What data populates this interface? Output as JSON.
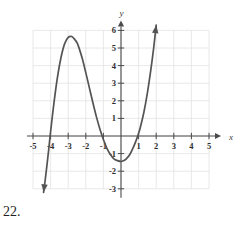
{
  "problem": {
    "number_label": "22."
  },
  "figure": {
    "name": "cubic-function-graph",
    "axis_labels": {
      "x": "x",
      "y": "y"
    },
    "colors": {
      "curve": "#545454",
      "axis": "#4a4a4a",
      "grid": "#e2e2e2",
      "text": "#2e2e2e"
    }
  },
  "chart_data": {
    "type": "line",
    "title": "",
    "xlabel": "x",
    "ylabel": "y",
    "xlim": [
      -5,
      5
    ],
    "ylim": [
      -3,
      6
    ],
    "grid": true,
    "legend": "none",
    "xticks": [
      -5,
      -4,
      -3,
      -2,
      -1,
      1,
      2,
      3,
      4,
      5
    ],
    "xtick_labels": [
      "-5",
      "-4",
      "-3",
      "-2",
      "-1",
      "1",
      "2",
      "3",
      "4",
      "5"
    ],
    "yticks": [
      -3,
      -2,
      -1,
      1,
      2,
      3,
      4,
      5,
      6
    ],
    "ytick_labels": [
      "-3",
      "-2",
      "-1",
      "1",
      "2",
      "3",
      "4",
      "5",
      "6"
    ],
    "series": [
      {
        "name": "cubic",
        "style": "solid",
        "arrows": [
          "start",
          "end"
        ],
        "x": [
          -4.4,
          -4.3,
          -4.2,
          -4.1,
          -4.0,
          -3.8,
          -3.6,
          -3.4,
          -3.2,
          -3.0,
          -2.8,
          -2.6,
          -2.5,
          -2.4,
          -2.2,
          -2.0,
          -1.8,
          -1.6,
          -1.4,
          -1.2,
          -1.0,
          -0.8,
          -0.6,
          -0.4,
          -0.2,
          0.0,
          0.15,
          0.3,
          0.5,
          0.7,
          0.9,
          1.0,
          1.1,
          1.3,
          1.5,
          1.7,
          1.85,
          2.0,
          2.2,
          2.4,
          2.6,
          2.75
        ],
        "y": [
          -3.2,
          -2.45,
          -1.6,
          -0.7,
          0.25,
          1.95,
          3.4,
          4.5,
          5.25,
          5.6,
          5.65,
          5.45,
          5.3,
          5.05,
          4.4,
          3.6,
          2.75,
          1.9,
          1.1,
          0.4,
          -0.2,
          -0.7,
          -1.05,
          -1.3,
          -1.4,
          -1.45,
          -1.4,
          -1.3,
          -1.05,
          -0.65,
          -0.15,
          0.15,
          0.5,
          1.35,
          2.45,
          3.8,
          4.95,
          6.3,
          7.9,
          9.7,
          11.6,
          13.2
        ]
      }
    ],
    "features": {
      "x_intercepts": [
        -4.1,
        0.15,
        1.85
      ],
      "local_maximum": {
        "x": -2.7,
        "y": 5.65
      },
      "local_minimum": {
        "x": 0.05,
        "y": -1.45
      }
    }
  }
}
